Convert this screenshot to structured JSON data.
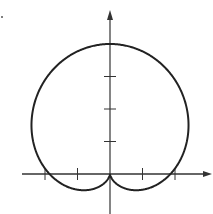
{
  "chart_data": {
    "type": "line",
    "title": "",
    "subtitle": "",
    "xlabel": "",
    "ylabel": "",
    "coordinate_system": "polar",
    "equation_estimate": "r = 2 + 2 sin(theta)",
    "grid": false,
    "legend": null,
    "xlim": [
      -2.6,
      3.1
    ],
    "ylim": [
      -1.2,
      5.0
    ],
    "x_ticks": [
      -2,
      -1,
      1,
      2
    ],
    "y_ticks": [
      1,
      2,
      3
    ],
    "tick_labels_shown": false,
    "key_points": [
      {
        "label": "top",
        "x": 0,
        "y": 4
      },
      {
        "label": "right-axis-crossing",
        "x": 2,
        "y": 0
      },
      {
        "label": "left-axis-crossing",
        "x": -2,
        "y": 0
      },
      {
        "label": "cusp-origin",
        "x": 0,
        "y": 0
      },
      {
        "label": "lower-lobe-min-right",
        "x": 0.9,
        "y": -0.5
      },
      {
        "label": "lower-lobe-min-left",
        "x": -0.9,
        "y": -0.5
      },
      {
        "label": "widest-right",
        "x": 2.3,
        "y": 1.4
      },
      {
        "label": "widest-left",
        "x": -2.3,
        "y": 1.4
      }
    ],
    "series": [
      {
        "name": "curve",
        "color": "#222222",
        "stroke_width": 2
      }
    ]
  },
  "style": {
    "axis_color": "#333333",
    "curve_color": "#222222",
    "background": "#ffffff"
  },
  "layout": {
    "origin_px": [
      110,
      174
    ],
    "unit_px": 32.5,
    "x_axis_px": [
      22,
      210
    ],
    "y_axis_px": [
      12,
      214
    ]
  }
}
